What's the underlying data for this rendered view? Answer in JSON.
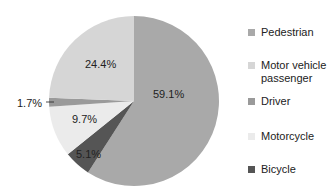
{
  "chart_data": {
    "type": "pie",
    "title": "",
    "start_angle": "12 o'clock, clockwise",
    "slices": [
      {
        "label": "Pedestrian",
        "value": 59.1,
        "display": "59.1%",
        "color": "#a9a9a9"
      },
      {
        "label": "Bicycle",
        "value": 5.1,
        "display": "5.1%",
        "color": "#555555"
      },
      {
        "label": "Motorcycle",
        "value": 9.7,
        "display": "9.7%",
        "color": "#ebebeb"
      },
      {
        "label": "Driver",
        "value": 1.7,
        "display": "1.7%",
        "color": "#9a9a9a"
      },
      {
        "label": "Motor vehicle passenger",
        "value": 24.4,
        "display": "24.4%",
        "color": "#d6d6d6"
      }
    ],
    "legend": {
      "position": "right",
      "entries": [
        {
          "label": "Pedestrian",
          "color": "#a9a9a9"
        },
        {
          "label": "Motor vehicle passenger",
          "color": "#d6d6d6"
        },
        {
          "label": "Driver",
          "color": "#9a9a9a"
        },
        {
          "label": "Motorcycle",
          "color": "#ebebeb"
        },
        {
          "label": "Bicycle",
          "color": "#555555"
        }
      ]
    }
  },
  "labels": {
    "pedestrian": "59.1%",
    "passenger": "24.4%",
    "driver": "1.7%",
    "motorcycle": "9.7%",
    "bicycle": "5.1%"
  },
  "legend": {
    "pedestrian": "Pedestrian",
    "passenger_1": "Motor vehicle",
    "passenger_2": "passenger",
    "driver": "Driver",
    "motorcycle": "Motorcycle",
    "bicycle": "Bicycle"
  }
}
